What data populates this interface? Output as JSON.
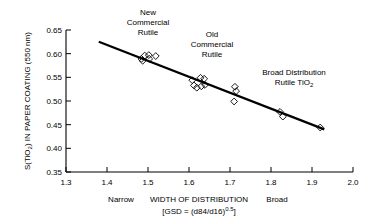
{
  "chart_data": {
    "type": "scatter",
    "title": "",
    "xlabel": "WIDTH OF DISTRIBUTION",
    "xlabel_sub": "[GSD = (d84/d16)0.5]",
    "ylabel": "S(TiO2) IN PAPER COATING (550 nm)",
    "xlim": [
      1.3,
      2.0
    ],
    "ylim": [
      0.35,
      0.65
    ],
    "xticks": [
      "1.3",
      "1.4",
      "1.5",
      "1.6",
      "1.7",
      "1.8",
      "1.9",
      "2.0"
    ],
    "xtick_values": [
      1.3,
      1.4,
      1.5,
      1.6,
      1.7,
      1.8,
      1.9,
      2.0
    ],
    "yticks": [
      "0.35",
      "0.40",
      "0.45",
      "0.50",
      "0.55",
      "0.60",
      "0.65"
    ],
    "ytick_values": [
      0.35,
      0.4,
      0.45,
      0.5,
      0.55,
      0.6,
      0.65
    ],
    "grid": false,
    "legend": "none",
    "marker_shape": "open-diamond",
    "points": [
      {
        "x": 1.484,
        "y": 0.589
      },
      {
        "x": 1.487,
        "y": 0.585
      },
      {
        "x": 1.492,
        "y": 0.596
      },
      {
        "x": 1.502,
        "y": 0.597
      },
      {
        "x": 1.503,
        "y": 0.589
      },
      {
        "x": 1.519,
        "y": 0.595
      },
      {
        "x": 1.608,
        "y": 0.544
      },
      {
        "x": 1.612,
        "y": 0.533
      },
      {
        "x": 1.619,
        "y": 0.528
      },
      {
        "x": 1.628,
        "y": 0.549
      },
      {
        "x": 1.63,
        "y": 0.531
      },
      {
        "x": 1.637,
        "y": 0.547
      },
      {
        "x": 1.639,
        "y": 0.534
      },
      {
        "x": 1.712,
        "y": 0.53
      },
      {
        "x": 1.715,
        "y": 0.521
      },
      {
        "x": 1.71,
        "y": 0.499
      },
      {
        "x": 1.822,
        "y": 0.477
      },
      {
        "x": 1.829,
        "y": 0.467
      },
      {
        "x": 1.92,
        "y": 0.444
      }
    ],
    "trend_line": {
      "x1": 1.38,
      "y1": 0.625,
      "x2": 1.93,
      "y2": 0.44
    },
    "annotations": [
      {
        "id": "new-commercial-rutile",
        "lines": [
          "New",
          "Commercial",
          "Rutile"
        ],
        "x": 1.5,
        "y": 0.672
      },
      {
        "id": "old-commercial-rutile",
        "lines": [
          "Old",
          "Commercial",
          "Rutile"
        ],
        "x": 1.655,
        "y": 0.628
      },
      {
        "id": "broad-distribution-rutile",
        "lines": [
          "Broad Distribution",
          "Rutile TiO2"
        ],
        "x": 1.855,
        "y": 0.56
      }
    ],
    "axis_end_labels": [
      {
        "id": "narrow",
        "text": "Narrow",
        "x": 1.435
      },
      {
        "id": "broad",
        "text": "Broad",
        "x": 1.815
      }
    ]
  },
  "labels": {
    "ylabel_main": "S(TiO",
    "ylabel_sub": "2",
    "ylabel_rest": ") IN PAPER COATING (550 nm)",
    "xlabel": "WIDTH OF DISTRIBUTION",
    "narrow": "Narrow",
    "broad": "Broad",
    "gsd_prefix": "[GSD = (d84/d16)",
    "gsd_exp": "0.5",
    "gsd_suffix": "]",
    "ann1_l1": "New",
    "ann1_l2": "Commercial",
    "ann1_l3": "Rutile",
    "ann2_l1": "Old",
    "ann2_l2": "Commercial",
    "ann2_l3": "Rutile",
    "ann3_l1": "Broad Distribution",
    "ann3_l2_pre": "Rutile TiO",
    "ann3_l2_sub": "2",
    "xt0": "1.3",
    "xt1": "1.4",
    "xt2": "1.5",
    "xt3": "1.6",
    "xt4": "1.7",
    "xt5": "1.8",
    "xt6": "1.9",
    "xt7": "2.0",
    "yt0": "0.35",
    "yt1": "0.40",
    "yt2": "0.45",
    "yt3": "0.50",
    "yt4": "0.55",
    "yt5": "0.60",
    "yt6": "0.65"
  },
  "colors": {
    "axis": "#000000",
    "marker": "#000000",
    "background": "#ffffff",
    "trend": "#000000"
  }
}
